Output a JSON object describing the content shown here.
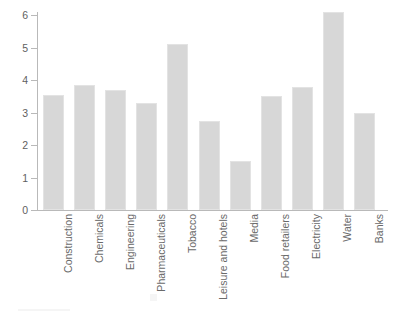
{
  "chart_data": {
    "type": "bar",
    "title": "",
    "subtitle": "",
    "xlabel": "",
    "ylabel": "",
    "ylim": [
      0,
      6.25
    ],
    "yticks": [
      "0",
      "1",
      "2",
      "3",
      "4",
      "5",
      "6"
    ],
    "ytick_values": [
      0,
      1,
      2,
      3,
      4,
      5,
      6
    ],
    "grid": false,
    "legend": false,
    "legend_position": "none",
    "bar_color": "#d7d7d7",
    "bar_edge_color": "#e3e3e3",
    "axis_color": "#b9b9b9",
    "text_color": "#6a6a6a",
    "xtick_rotation": 90,
    "categories": [
      "Construction",
      "Chemicals",
      "Engineering",
      "Pharmaceuticals",
      "Tobacco",
      "Leisure and hotels",
      "Media",
      "Food retailers",
      "Electricity",
      "Water",
      "Banks"
    ],
    "values": [
      3.55,
      3.85,
      3.7,
      3.3,
      5.1,
      2.75,
      1.5,
      3.5,
      3.78,
      6.08,
      2.97
    ]
  }
}
